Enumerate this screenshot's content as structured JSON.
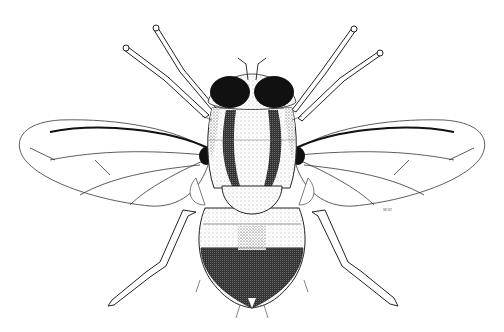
{
  "image": {
    "subject": "fly",
    "style": "black-and-white stipple illustration, dorsal view",
    "background": "#ffffff",
    "ink": "#111111",
    "signature": "MAH"
  }
}
